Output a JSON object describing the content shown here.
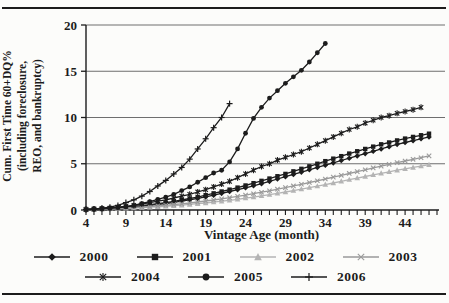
{
  "figure": {
    "y_axis_label_lines": [
      "Cum. First Time 60+DQ%",
      "(including foreclosure,",
      "REO, and bankruptcy)"
    ],
    "x_axis_label": "Vintage Age (month)"
  },
  "colors": {
    "ink": "#1c1c1c",
    "grid": "#6e6e6e",
    "gray_2002": "#b4b4b4",
    "gray_2003": "#9a9a9a",
    "background": "#fcfcfa"
  },
  "chart_data": {
    "type": "line",
    "title": "",
    "xlabel": "Vintage Age (month)",
    "ylabel": "Cum. First Time 60+DQ% (including foreclosure, REO, and bankruptcy)",
    "x_range": [
      4,
      48
    ],
    "y_range": [
      0,
      20
    ],
    "x_ticks": [
      4,
      9,
      14,
      19,
      24,
      29,
      34,
      39,
      44
    ],
    "x_minor_tick_step": 1,
    "y_ticks": [
      0,
      5,
      10,
      15,
      20
    ],
    "grid": "horizontal",
    "legend_position": "bottom",
    "legend_rows": [
      4,
      3
    ],
    "series": [
      {
        "name": "2000",
        "marker": "diamond",
        "color": "#1c1c1c",
        "start_month": 4,
        "values": [
          0.08,
          0.1,
          0.13,
          0.17,
          0.22,
          0.28,
          0.34,
          0.42,
          0.5,
          0.6,
          0.7,
          0.82,
          0.95,
          1.1,
          1.25,
          1.42,
          1.6,
          1.8,
          2.0,
          2.2,
          2.4,
          2.62,
          2.85,
          3.1,
          3.35,
          3.6,
          3.85,
          4.1,
          4.35,
          4.6,
          4.85,
          5.1,
          5.35,
          5.6,
          5.85,
          6.1,
          6.35,
          6.6,
          6.85,
          7.1,
          7.3,
          7.5,
          7.7,
          7.9
        ]
      },
      {
        "name": "2001",
        "marker": "square",
        "color": "#1c1c1c",
        "start_month": 4,
        "values": [
          0.1,
          0.13,
          0.16,
          0.2,
          0.26,
          0.33,
          0.4,
          0.48,
          0.58,
          0.68,
          0.8,
          0.93,
          1.08,
          1.24,
          1.4,
          1.6,
          1.8,
          2.0,
          2.2,
          2.42,
          2.65,
          2.9,
          3.15,
          3.4,
          3.65,
          3.9,
          4.18,
          4.45,
          4.72,
          5.0,
          5.28,
          5.55,
          5.82,
          6.1,
          6.35,
          6.6,
          6.85,
          7.1,
          7.3,
          7.52,
          7.72,
          7.9,
          8.08,
          8.25
        ]
      },
      {
        "name": "2002",
        "marker": "triangle",
        "color": "#b4b4b4",
        "start_month": 4,
        "values": [
          0.05,
          0.07,
          0.09,
          0.12,
          0.15,
          0.18,
          0.22,
          0.26,
          0.3,
          0.35,
          0.4,
          0.46,
          0.52,
          0.6,
          0.68,
          0.76,
          0.85,
          0.95,
          1.05,
          1.16,
          1.28,
          1.4,
          1.53,
          1.66,
          1.8,
          1.95,
          2.1,
          2.26,
          2.42,
          2.58,
          2.75,
          2.92,
          3.1,
          3.28,
          3.45,
          3.62,
          3.8,
          3.97,
          4.13,
          4.3,
          4.45,
          4.6,
          4.75,
          4.9
        ]
      },
      {
        "name": "2003",
        "marker": "x",
        "color": "#9a9a9a",
        "start_month": 4,
        "values": [
          0.06,
          0.08,
          0.11,
          0.14,
          0.18,
          0.22,
          0.27,
          0.32,
          0.38,
          0.44,
          0.51,
          0.59,
          0.67,
          0.76,
          0.86,
          0.97,
          1.08,
          1.2,
          1.33,
          1.47,
          1.61,
          1.76,
          1.92,
          2.08,
          2.25,
          2.42,
          2.6,
          2.78,
          2.97,
          3.16,
          3.35,
          3.55,
          3.75,
          3.95,
          4.15,
          4.35,
          4.55,
          4.74,
          4.93,
          5.12,
          5.3,
          5.48,
          5.65,
          5.85
        ]
      },
      {
        "name": "2004",
        "marker": "asterisk",
        "color": "#1c1c1c",
        "start_month": 4,
        "values": [
          0.05,
          0.1,
          0.15,
          0.2,
          0.3,
          0.4,
          0.5,
          0.65,
          0.8,
          0.95,
          1.1,
          1.3,
          1.5,
          1.7,
          1.95,
          2.2,
          2.5,
          2.8,
          3.1,
          3.5,
          3.9,
          4.3,
          4.7,
          5.0,
          5.4,
          5.7,
          6.0,
          6.3,
          6.7,
          7.1,
          7.5,
          7.9,
          8.3,
          8.7,
          9.0,
          9.4,
          9.7,
          10.0,
          10.2,
          10.45,
          10.65,
          10.85,
          11.1
        ]
      },
      {
        "name": "2005",
        "marker": "circle",
        "color": "#1c1c1c",
        "start_month": 4,
        "values": [
          0.05,
          0.08,
          0.12,
          0.18,
          0.25,
          0.35,
          0.5,
          0.7,
          0.9,
          1.15,
          1.4,
          1.7,
          2.1,
          2.5,
          3.0,
          3.5,
          4.0,
          4.3,
          5.2,
          6.6,
          8.3,
          9.9,
          11.1,
          12.1,
          12.9,
          13.7,
          14.4,
          15.1,
          16.0,
          17.0,
          18.0
        ]
      },
      {
        "name": "2006",
        "marker": "plus",
        "color": "#1c1c1c",
        "start_month": 4,
        "values": [
          0.05,
          0.1,
          0.2,
          0.3,
          0.5,
          0.8,
          1.1,
          1.5,
          2.0,
          2.6,
          3.2,
          3.9,
          4.6,
          5.5,
          6.6,
          7.7,
          8.9,
          10.0,
          11.5
        ]
      }
    ]
  }
}
